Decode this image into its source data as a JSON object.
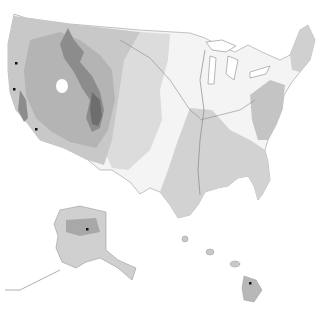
{
  "map": {
    "type": "shaded elevation map",
    "regions": [
      "contiguous-us",
      "alaska",
      "hawaii"
    ],
    "colors": {
      "background": "#ffffff",
      "lowland": "#f4f4f4",
      "plains": "#dcdcdc",
      "uplands": "#c8c8c8",
      "plateau": "#b4b4b4",
      "mountains": "#8c8c8c",
      "high-mountains": "#6e6e6e",
      "border": "#9a9a9a",
      "river": "#8a8a8a",
      "marker": "#111111"
    },
    "markers": [
      {
        "name": "marker-washington",
        "x": 16,
        "y": 63
      },
      {
        "name": "marker-oregon",
        "x": 14,
        "y": 89
      },
      {
        "name": "marker-california",
        "x": 36,
        "y": 129
      },
      {
        "name": "marker-alaska",
        "x": 87,
        "y": 229
      },
      {
        "name": "marker-hawaii",
        "x": 250,
        "y": 283
      }
    ]
  }
}
